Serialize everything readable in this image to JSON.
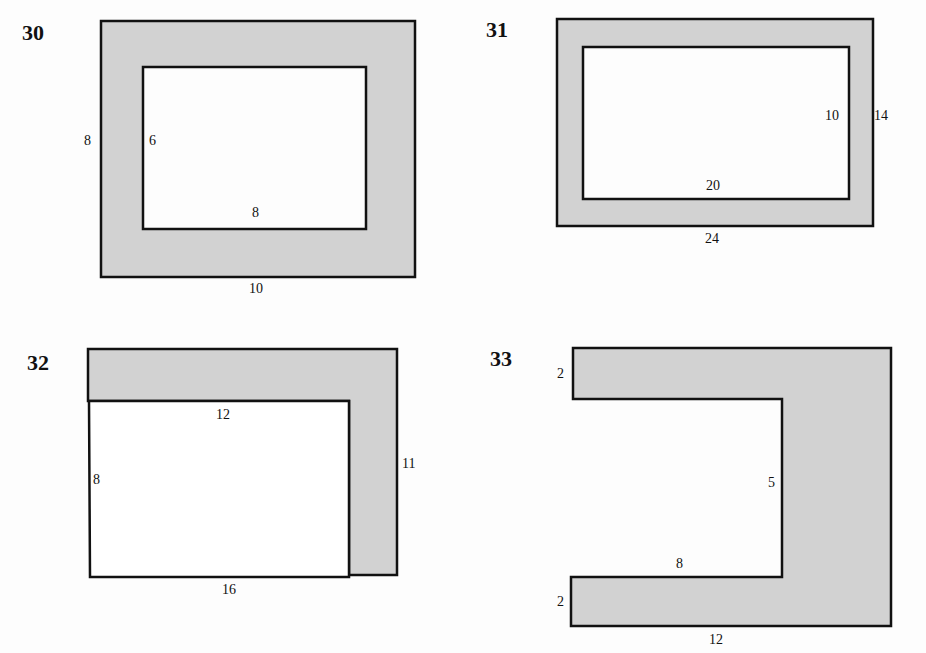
{
  "colors": {
    "fill": "#d2d2d2",
    "stroke": "#111111",
    "background": "#fdfdfd"
  },
  "figures": [
    {
      "number": "30",
      "shape": "rectangular frame (outer rectangle minus inner rectangle)",
      "labels": {
        "outer_height": "8",
        "inner_height": "6",
        "inner_width": "8",
        "outer_width": "10"
      }
    },
    {
      "number": "31",
      "shape": "rectangular frame (outer rectangle minus inner rectangle)",
      "labels": {
        "inner_height": "10",
        "outer_height": "14",
        "inner_width": "20",
        "outer_width": "24"
      }
    },
    {
      "number": "32",
      "shape": "L-shaped border along top and right of rectangle",
      "labels": {
        "inner_width": "12",
        "inner_height": "8",
        "outer_height": "11",
        "outer_width": "16"
      }
    },
    {
      "number": "33",
      "shape": "U-shaped region opening to the left",
      "labels": {
        "top_arm": "2",
        "notch_height": "5",
        "notch_width": "8",
        "bottom_arm": "2",
        "outer_width": "12"
      }
    }
  ]
}
